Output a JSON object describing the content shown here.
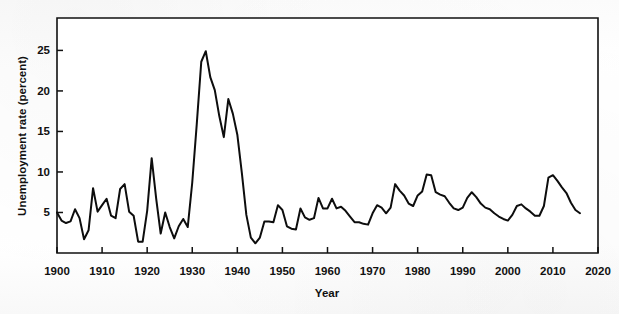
{
  "figure": {
    "background_color": "#fdfdfd",
    "line_color": "#0d0d0d",
    "axis_color": "#111111"
  },
  "axes": {
    "x_title": "Year",
    "y_title": "Unemployment rate (percent)",
    "x_ticks": [
      1900,
      1910,
      1920,
      1930,
      1940,
      1950,
      1960,
      1970,
      1980,
      1990,
      2000,
      2010,
      2020
    ],
    "y_ticks": [
      5,
      10,
      15,
      20,
      25
    ],
    "x_range": [
      1900,
      2020
    ],
    "y_range": [
      0,
      29
    ]
  },
  "chart_data": {
    "type": "line",
    "title": "",
    "subtitle": "",
    "xlabel": "Year",
    "ylabel": "Unemployment rate (percent)",
    "xlim": [
      1900,
      2020
    ],
    "ylim": [
      0,
      29
    ],
    "grid": false,
    "legend": "none",
    "series": [
      {
        "name": "Unemployment rate",
        "color": "#0d0d0d",
        "x": [
          1900,
          1901,
          1902,
          1903,
          1904,
          1905,
          1906,
          1907,
          1908,
          1909,
          1910,
          1911,
          1912,
          1913,
          1914,
          1915,
          1916,
          1917,
          1918,
          1919,
          1920,
          1921,
          1922,
          1923,
          1924,
          1925,
          1926,
          1927,
          1928,
          1929,
          1930,
          1931,
          1932,
          1933,
          1934,
          1935,
          1936,
          1937,
          1938,
          1939,
          1940,
          1941,
          1942,
          1943,
          1944,
          1945,
          1946,
          1947,
          1948,
          1949,
          1950,
          1951,
          1952,
          1953,
          1954,
          1955,
          1956,
          1957,
          1958,
          1959,
          1960,
          1961,
          1962,
          1963,
          1964,
          1965,
          1966,
          1967,
          1968,
          1969,
          1970,
          1971,
          1972,
          1973,
          1974,
          1975,
          1976,
          1977,
          1978,
          1979,
          1980,
          1981,
          1982,
          1983,
          1984,
          1985,
          1986,
          1987,
          1988,
          1989,
          1990,
          1991,
          1992,
          1993,
          1994,
          1995,
          1996,
          1997,
          1998,
          1999,
          2000,
          2001,
          2002,
          2003,
          2004,
          2005,
          2006,
          2007,
          2008,
          2009,
          2010,
          2011,
          2012,
          2013,
          2014,
          2015,
          2016
        ],
        "values": [
          5.0,
          4.0,
          3.7,
          3.9,
          5.4,
          4.3,
          1.7,
          2.8,
          8.0,
          5.1,
          5.9,
          6.7,
          4.6,
          4.3,
          7.9,
          8.5,
          5.1,
          4.6,
          1.4,
          1.4,
          5.2,
          11.7,
          6.7,
          2.4,
          5.0,
          3.2,
          1.8,
          3.3,
          4.2,
          3.2,
          8.7,
          15.9,
          23.6,
          24.9,
          21.7,
          20.1,
          16.9,
          14.3,
          19.0,
          17.2,
          14.6,
          9.9,
          4.7,
          1.9,
          1.2,
          1.9,
          3.9,
          3.9,
          3.8,
          5.9,
          5.3,
          3.3,
          3.0,
          2.9,
          5.5,
          4.4,
          4.1,
          4.3,
          6.8,
          5.5,
          5.5,
          6.7,
          5.5,
          5.7,
          5.2,
          4.5,
          3.8,
          3.8,
          3.6,
          3.5,
          4.9,
          5.9,
          5.6,
          4.9,
          5.6,
          8.5,
          7.7,
          7.1,
          6.1,
          5.8,
          7.1,
          7.6,
          9.7,
          9.6,
          7.5,
          7.2,
          7.0,
          6.2,
          5.5,
          5.3,
          5.6,
          6.8,
          7.5,
          6.9,
          6.1,
          5.6,
          5.4,
          4.9,
          4.5,
          4.2,
          4.0,
          4.7,
          5.8,
          6.0,
          5.5,
          5.1,
          4.6,
          4.6,
          5.8,
          9.3,
          9.6,
          8.9,
          8.1,
          7.4,
          6.2,
          5.3,
          4.9
        ]
      }
    ],
    "annotations": [
      {
        "label": "Great Depression peak",
        "x": 1933,
        "y": 24.9
      },
      {
        "label": "Post-1920 recession spike",
        "x": 1921,
        "y": 11.7
      },
      {
        "label": "World War II trough",
        "x": 1944,
        "y": 1.2
      },
      {
        "label": "Great Recession peak",
        "x": 2010,
        "y": 9.6
      }
    ]
  }
}
